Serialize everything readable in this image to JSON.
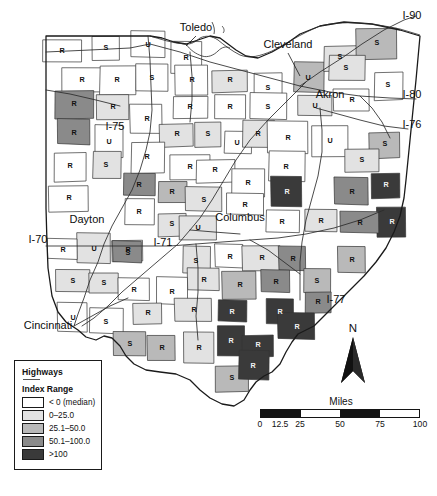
{
  "map": {
    "title": "Ohio county choropleth — Highways Index Range",
    "state": "Ohio",
    "cities": [
      {
        "name": "Toledo",
        "x": 196,
        "y": 31
      },
      {
        "name": "Cleveland",
        "x": 288,
        "y": 48
      },
      {
        "name": "Akron",
        "x": 330,
        "y": 98
      },
      {
        "name": "Columbus",
        "x": 240,
        "y": 221
      },
      {
        "name": "Dayton",
        "x": 87,
        "y": 223
      },
      {
        "name": "Cincinnati",
        "x": 48,
        "y": 329
      }
    ],
    "highway_labels": [
      {
        "name": "I-90",
        "x": 412,
        "y": 19
      },
      {
        "name": "I-80",
        "x": 412,
        "y": 98
      },
      {
        "name": "I-76",
        "x": 412,
        "y": 128
      },
      {
        "name": "I-75",
        "x": 115,
        "y": 130
      },
      {
        "name": "I-70",
        "x": 38,
        "y": 243
      },
      {
        "name": "I-71",
        "x": 163,
        "y": 246
      },
      {
        "name": "I-77",
        "x": 336,
        "y": 303
      }
    ]
  },
  "legend": {
    "title": "Highways",
    "subtitle": "Index Range",
    "classes": [
      {
        "label": "< 0 (median)",
        "color": "#ffffff"
      },
      {
        "label": "0–25.0",
        "color": "#e2e2e2"
      },
      {
        "label": "25.1–50.0",
        "color": "#b9b9b9"
      },
      {
        "label": "50.1–100.0",
        "color": "#8a8a8a"
      },
      {
        "label": ">100",
        "color": "#3a3a3a"
      }
    ]
  },
  "north_arrow": {
    "label": "N"
  },
  "scalebar": {
    "title": "Miles",
    "ticks": [
      "0",
      "12.5",
      "25",
      "50",
      "75",
      "100"
    ],
    "tick_positions_pct": [
      0,
      12.5,
      25,
      50,
      75,
      100
    ],
    "segment_fills": [
      "#141414",
      "#141414",
      "#ffffff",
      "#141414",
      "#ffffff"
    ]
  },
  "chart_data": {
    "type": "heatmap",
    "legend_position": "bottom-left",
    "classes": [
      "< 0 (median)",
      "0–25.0",
      "25.1–50.0",
      "50.1–100.0",
      ">100"
    ],
    "class_colors": [
      "#ffffff",
      "#e2e2e2",
      "#b9b9b9",
      "#8a8a8a",
      "#3a3a3a"
    ],
    "point_labels": [
      "R",
      "S",
      "U"
    ],
    "counties": [
      {
        "id": "williams",
        "letter": "R",
        "cls": 0,
        "lx": 62,
        "ly": 51
      },
      {
        "id": "fulton",
        "letter": "S",
        "cls": 0,
        "lx": 106,
        "ly": 48
      },
      {
        "id": "lucas",
        "letter": "U",
        "cls": 0,
        "lx": 148,
        "ly": 45
      },
      {
        "id": "ottawa",
        "letter": "R",
        "cls": 0,
        "lx": 186,
        "ly": 58
      },
      {
        "id": "sandusky",
        "letter": "R",
        "cls": 0,
        "lx": 192,
        "ly": 80
      },
      {
        "id": "erie",
        "letter": "R",
        "cls": 1,
        "lx": 230,
        "ly": 80
      },
      {
        "id": "lorain",
        "letter": "S",
        "cls": 0,
        "lx": 268,
        "ly": 88
      },
      {
        "id": "cuyahoga",
        "letter": "U",
        "cls": 2,
        "lx": 308,
        "ly": 78
      },
      {
        "id": "lake",
        "letter": "S",
        "cls": 1,
        "lx": 340,
        "ly": 57
      },
      {
        "id": "ashtabula",
        "letter": "S",
        "cls": 2,
        "lx": 377,
        "ly": 43
      },
      {
        "id": "geauga",
        "letter": "S",
        "cls": 1,
        "lx": 346,
        "ly": 68
      },
      {
        "id": "trumbull",
        "letter": "S",
        "cls": 0,
        "lx": 388,
        "ly": 85
      },
      {
        "id": "defiance",
        "letter": "R",
        "cls": 0,
        "lx": 82,
        "ly": 80
      },
      {
        "id": "henry",
        "letter": "R",
        "cls": 0,
        "lx": 117,
        "ly": 80
      },
      {
        "id": "wood",
        "letter": "S",
        "cls": 0,
        "lx": 152,
        "ly": 78
      },
      {
        "id": "paulding",
        "letter": "R",
        "cls": 3,
        "lx": 74,
        "ly": 104
      },
      {
        "id": "putnam",
        "letter": "R",
        "cls": 1,
        "lx": 113,
        "ly": 107
      },
      {
        "id": "seneca",
        "letter": "R",
        "cls": 0,
        "lx": 190,
        "ly": 107
      },
      {
        "id": "huron",
        "letter": "R",
        "cls": 0,
        "lx": 230,
        "ly": 107
      },
      {
        "id": "medina",
        "letter": "S",
        "cls": 0,
        "lx": 268,
        "ly": 107
      },
      {
        "id": "summit",
        "letter": "U",
        "cls": 1,
        "lx": 315,
        "ly": 106
      },
      {
        "id": "portage",
        "letter": "R",
        "cls": 0,
        "lx": 352,
        "ly": 100
      },
      {
        "id": "vanwert",
        "letter": "R",
        "cls": 3,
        "lx": 74,
        "ly": 133
      },
      {
        "id": "allen",
        "letter": "U",
        "cls": 0,
        "lx": 109,
        "ly": 142
      },
      {
        "id": "hancock",
        "letter": "R",
        "cls": 0,
        "lx": 147,
        "ly": 119
      },
      {
        "id": "wyandot",
        "letter": "R",
        "cls": 1,
        "lx": 177,
        "ly": 134
      },
      {
        "id": "crawford",
        "letter": "S",
        "cls": 1,
        "lx": 208,
        "ly": 134
      },
      {
        "id": "richland",
        "letter": "U",
        "cls": 0,
        "lx": 237,
        "ly": 143
      },
      {
        "id": "ashland",
        "letter": "R",
        "cls": 1,
        "lx": 258,
        "ly": 134
      },
      {
        "id": "wayne",
        "letter": "R",
        "cls": 0,
        "lx": 288,
        "ly": 138
      },
      {
        "id": "stark",
        "letter": "U",
        "cls": 0,
        "lx": 330,
        "ly": 141
      },
      {
        "id": "mahoning",
        "letter": "S",
        "cls": 2,
        "lx": 385,
        "ly": 144
      },
      {
        "id": "mercer",
        "letter": "R",
        "cls": 0,
        "lx": 70,
        "ly": 166
      },
      {
        "id": "auglaize",
        "letter": "S",
        "cls": 1,
        "lx": 106,
        "ly": 165
      },
      {
        "id": "hardin",
        "letter": "R",
        "cls": 0,
        "lx": 147,
        "ly": 157
      },
      {
        "id": "marion",
        "letter": "R",
        "cls": 0,
        "lx": 190,
        "ly": 167
      },
      {
        "id": "morrow",
        "letter": "R",
        "cls": 0,
        "lx": 215,
        "ly": 170
      },
      {
        "id": "knox",
        "letter": "R",
        "cls": 0,
        "lx": 248,
        "ly": 183
      },
      {
        "id": "holmes",
        "letter": "R",
        "cls": 0,
        "lx": 286,
        "ly": 167
      },
      {
        "id": "columbiana",
        "letter": "S",
        "cls": 1,
        "lx": 362,
        "ly": 160
      },
      {
        "id": "darke",
        "letter": "R",
        "cls": 0,
        "lx": 69,
        "ly": 198
      },
      {
        "id": "shelby",
        "letter": "R",
        "cls": 3,
        "lx": 139,
        "ly": 185
      },
      {
        "id": "logan",
        "letter": "R",
        "cls": 2,
        "lx": 172,
        "ly": 192
      },
      {
        "id": "union",
        "letter": "S",
        "cls": 1,
        "lx": 204,
        "ly": 200
      },
      {
        "id": "delaware",
        "letter": "R",
        "cls": 0,
        "lx": 245,
        "ly": 205
      },
      {
        "id": "coshocton",
        "letter": "R",
        "cls": 4,
        "lx": 287,
        "ly": 192
      },
      {
        "id": "tuscarawas",
        "letter": "R",
        "cls": 3,
        "lx": 352,
        "ly": 192
      },
      {
        "id": "carroll",
        "letter": "R",
        "cls": 4,
        "lx": 386,
        "ly": 185
      },
      {
        "id": "jefferson",
        "letter": "R",
        "cls": 4,
        "lx": 392,
        "ly": 222
      },
      {
        "id": "miami",
        "letter": "R",
        "cls": 0,
        "lx": 139,
        "ly": 212
      },
      {
        "id": "champaign",
        "letter": "S",
        "cls": 1,
        "lx": 172,
        "ly": 224
      },
      {
        "id": "franklin",
        "letter": "U",
        "cls": 1,
        "lx": 198,
        "ly": 228
      },
      {
        "id": "licking",
        "letter": "R",
        "cls": 0,
        "lx": 282,
        "ly": 222
      },
      {
        "id": "guernsey",
        "letter": "R",
        "cls": 1,
        "lx": 321,
        "ly": 221
      },
      {
        "id": "harrison",
        "letter": "R",
        "cls": 3,
        "lx": 360,
        "ly": 223
      },
      {
        "id": "montgomery",
        "letter": "U",
        "cls": 1,
        "lx": 94,
        "ly": 249
      },
      {
        "id": "preble",
        "letter": "R",
        "cls": 0,
        "lx": 63,
        "ly": 250
      },
      {
        "id": "greene",
        "letter": "R",
        "cls": 0,
        "lx": 128,
        "ly": 250
      },
      {
        "id": "clark",
        "letter": "S",
        "cls": 3,
        "lx": 128,
        "ly": 253
      },
      {
        "id": "madison",
        "letter": "S",
        "cls": 1,
        "lx": 196,
        "ly": 261
      },
      {
        "id": "fairfield",
        "letter": "R",
        "cls": 0,
        "lx": 230,
        "ly": 257
      },
      {
        "id": "perry",
        "letter": "R",
        "cls": 1,
        "lx": 262,
        "ly": 258
      },
      {
        "id": "morgan",
        "letter": "R",
        "cls": 3,
        "lx": 293,
        "ly": 259
      },
      {
        "id": "noble",
        "letter": "S",
        "cls": 2,
        "lx": 317,
        "ly": 281
      },
      {
        "id": "belmont",
        "letter": "R",
        "cls": 2,
        "lx": 352,
        "ly": 260
      },
      {
        "id": "butler",
        "letter": "S",
        "cls": 1,
        "lx": 73,
        "ly": 281
      },
      {
        "id": "warren",
        "letter": "S",
        "cls": 1,
        "lx": 104,
        "ly": 283
      },
      {
        "id": "clinton",
        "letter": "R",
        "cls": 0,
        "lx": 134,
        "ly": 290
      },
      {
        "id": "fayette",
        "letter": "R",
        "cls": 0,
        "lx": 172,
        "ly": 292
      },
      {
        "id": "pickaway",
        "letter": "R",
        "cls": 1,
        "lx": 204,
        "ly": 280
      },
      {
        "id": "hocking",
        "letter": "R",
        "cls": 2,
        "lx": 240,
        "ly": 285
      },
      {
        "id": "muskingum",
        "letter": "R",
        "cls": 3,
        "lx": 276,
        "ly": 282
      },
      {
        "id": "washington",
        "letter": "R",
        "cls": 3,
        "lx": 318,
        "ly": 302
      },
      {
        "id": "hamilton",
        "letter": "U",
        "cls": 0,
        "lx": 73,
        "ly": 318
      },
      {
        "id": "clermont",
        "letter": "S",
        "cls": 0,
        "lx": 106,
        "ly": 322
      },
      {
        "id": "highland",
        "letter": "R",
        "cls": 1,
        "lx": 148,
        "ly": 313
      },
      {
        "id": "ross",
        "letter": "R",
        "cls": 1,
        "lx": 194,
        "ly": 310
      },
      {
        "id": "vinton",
        "letter": "R",
        "cls": 4,
        "lx": 232,
        "ly": 312
      },
      {
        "id": "athens",
        "letter": "R",
        "cls": 4,
        "lx": 280,
        "ly": 312
      },
      {
        "id": "meigs",
        "letter": "R",
        "cls": 4,
        "lx": 297,
        "ly": 327
      },
      {
        "id": "brown",
        "letter": "S",
        "cls": 2,
        "lx": 130,
        "ly": 344
      },
      {
        "id": "adams",
        "letter": "R",
        "cls": 2,
        "lx": 162,
        "ly": 348
      },
      {
        "id": "pike",
        "letter": "R",
        "cls": 1,
        "lx": 199,
        "ly": 348
      },
      {
        "id": "jackson",
        "letter": "R",
        "cls": 4,
        "lx": 231,
        "ly": 341
      },
      {
        "id": "gallia",
        "letter": "R",
        "cls": 4,
        "lx": 258,
        "ly": 345
      },
      {
        "id": "scioto",
        "letter": "S",
        "cls": 2,
        "lx": 232,
        "ly": 378
      },
      {
        "id": "lawrence",
        "letter": "R",
        "cls": 4,
        "lx": 253,
        "ly": 366
      }
    ]
  }
}
